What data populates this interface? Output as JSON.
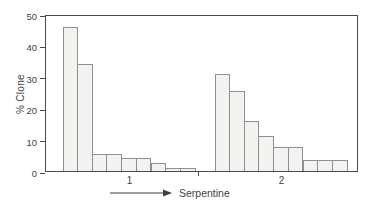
{
  "chart_data": {
    "type": "bar",
    "title": "",
    "ylabel": "% Clone",
    "xlabel": "Serpentine",
    "ylim": [
      0,
      50
    ],
    "yticks": [
      0,
      10,
      20,
      30,
      40,
      50
    ],
    "grid": false,
    "legend": "none",
    "groups": [
      {
        "label": "1",
        "values": [
          46,
          34,
          5.5,
          5.5,
          4,
          4,
          2.5,
          1,
          1
        ]
      },
      {
        "label": "2",
        "values": [
          31,
          25.5,
          16,
          11,
          7.5,
          7.5,
          3.5,
          3.5,
          3.5
        ]
      }
    ]
  },
  "colors": {
    "background": "#ffffff",
    "axis": "#4a4a4a",
    "text": "#3f3f3f",
    "bar_fill": "#f2f2f0",
    "bar_border": "#8f8f8f"
  }
}
